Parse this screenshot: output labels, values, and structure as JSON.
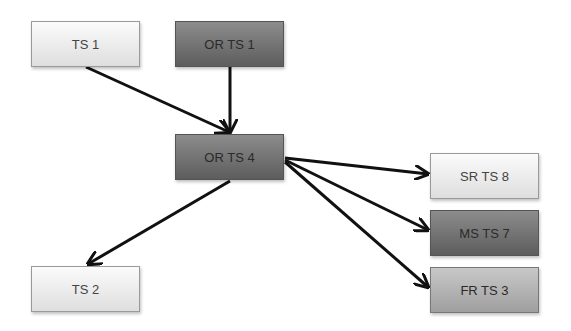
{
  "diagram": {
    "nodes": [
      {
        "id": "ts1",
        "label": "TS 1",
        "style": "light"
      },
      {
        "id": "orts1",
        "label": "OR TS 1",
        "style": "dark"
      },
      {
        "id": "orts4",
        "label": "OR TS 4",
        "style": "dark"
      },
      {
        "id": "srts8",
        "label": "SR TS 8",
        "style": "light"
      },
      {
        "id": "msts7",
        "label": "MS TS 7",
        "style": "dark"
      },
      {
        "id": "frts3",
        "label": "FR TS 3",
        "style": "mid"
      },
      {
        "id": "ts2",
        "label": "TS 2",
        "style": "light"
      }
    ],
    "edges": [
      {
        "from": "TS 1",
        "to": "OR TS 4"
      },
      {
        "from": "OR TS 1",
        "to": "OR TS 4"
      },
      {
        "from": "OR TS 4",
        "to": "SR TS 8"
      },
      {
        "from": "OR TS 4",
        "to": "MS TS 7"
      },
      {
        "from": "OR TS 4",
        "to": "FR TS 3"
      },
      {
        "from": "OR TS 4",
        "to": "TS 2"
      }
    ],
    "colors": {
      "edge": "#111111"
    }
  }
}
